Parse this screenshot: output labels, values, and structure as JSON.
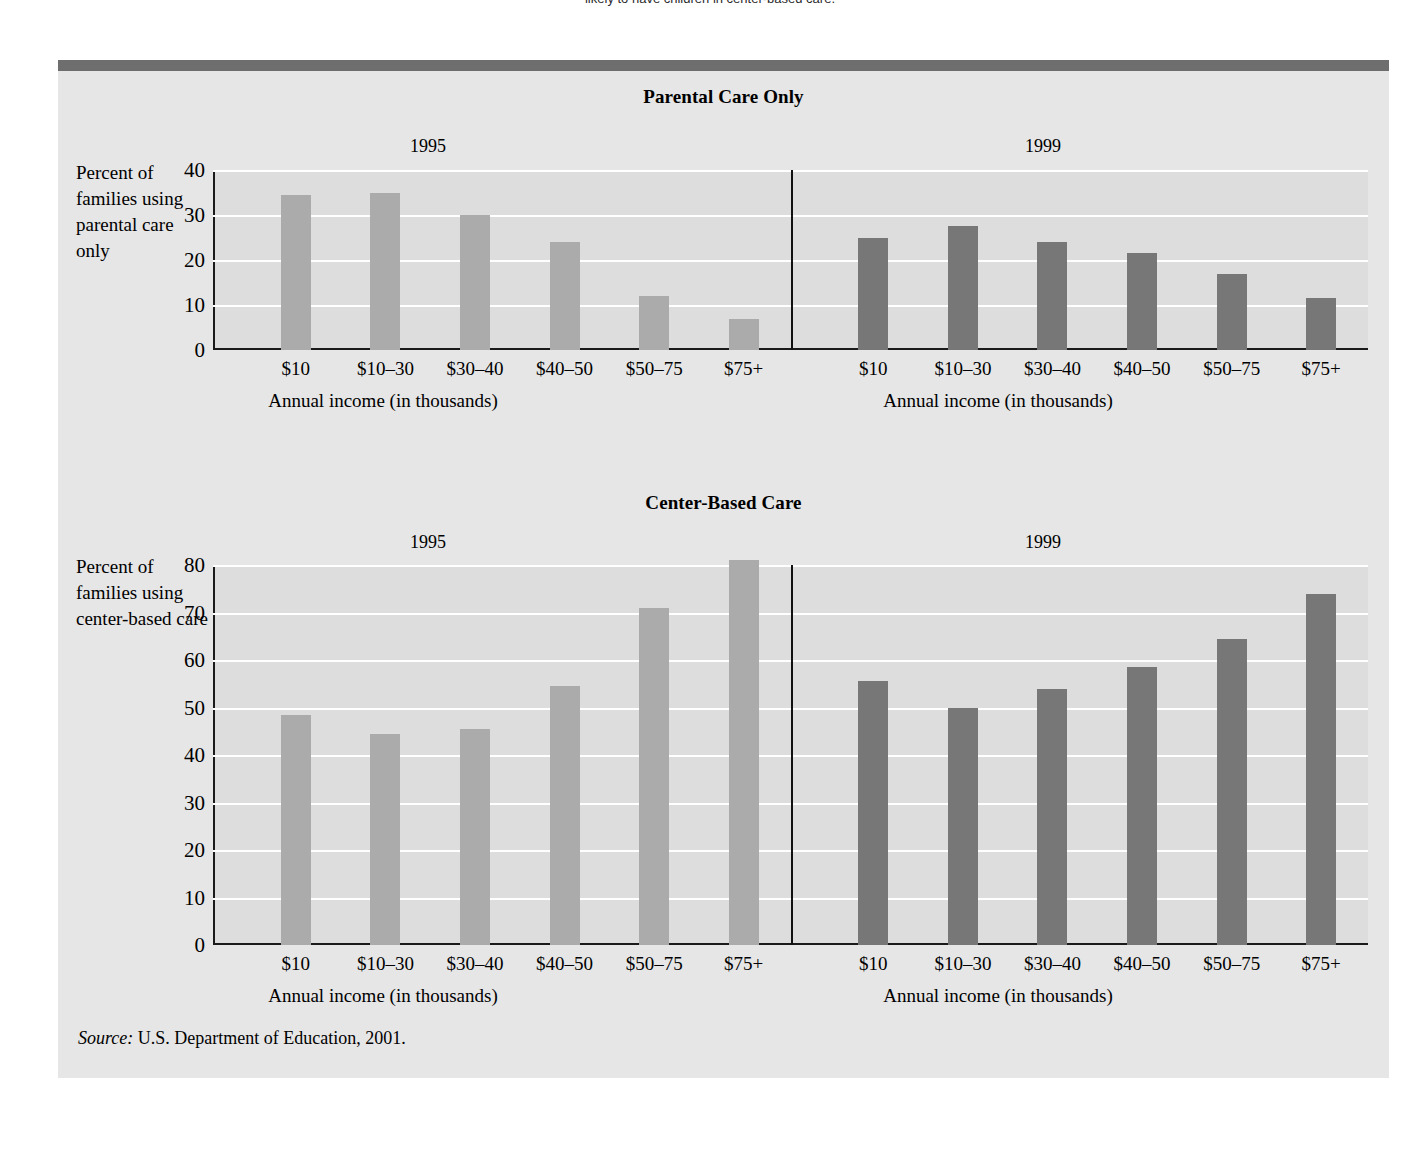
{
  "top_caption": {
    "prefix": "",
    "text": "likely to have children in center-based care."
  },
  "figure": {
    "source_label": "Source:",
    "source_text": " U.S. Department of Education, 2001."
  },
  "colors": {
    "bar_1995": "#ababab",
    "bar_1999": "#777777",
    "panel_background": "#e6e6e6",
    "plot_background": "#dddddd",
    "gridline": "#ffffff",
    "topbar": "#6e6e6e",
    "axis": "#1a1a1a"
  },
  "chart_data": [
    {
      "type": "bar",
      "title": "Parental Care Only",
      "xlabel": "Annual income (in thousands)",
      "ylabel": "Percent of families using parental care only",
      "categories": [
        "$10",
        "$10–30",
        "$30–40",
        "$40–50",
        "$50–75",
        "$75+"
      ],
      "ylim": [
        0,
        40
      ],
      "yticks": [
        0,
        10,
        20,
        30,
        40
      ],
      "grid": true,
      "legend": "none",
      "series": [
        {
          "name": "1995",
          "values": [
            34.5,
            35,
            30,
            24,
            12,
            7
          ]
        },
        {
          "name": "1999",
          "values": [
            25,
            27.5,
            24,
            21.5,
            17,
            11.5
          ]
        }
      ]
    },
    {
      "type": "bar",
      "title": "Center-Based Care",
      "xlabel": "Annual income (in thousands)",
      "ylabel": "Percent of families using center-based care",
      "categories": [
        "$10",
        "$10–30",
        "$30–40",
        "$40–50",
        "$50–75",
        "$75+"
      ],
      "ylim": [
        0,
        80
      ],
      "yticks": [
        0,
        10,
        20,
        30,
        40,
        50,
        60,
        70,
        80
      ],
      "grid": true,
      "legend": "none",
      "series": [
        {
          "name": "1995",
          "values": [
            48.5,
            44.5,
            45.5,
            54.5,
            71,
            81
          ]
        },
        {
          "name": "1999",
          "values": [
            55.5,
            50,
            54,
            58.5,
            64.5,
            74
          ]
        }
      ]
    }
  ]
}
